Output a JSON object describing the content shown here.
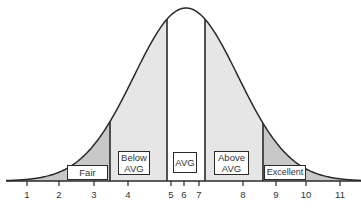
{
  "chart_data": {
    "type": "area",
    "title": "",
    "x_ticks": [
      1,
      2,
      3,
      4,
      5,
      6,
      7,
      8,
      9,
      10,
      11
    ],
    "xlim": [
      0.5,
      11.5
    ],
    "grid": false,
    "mean": 6,
    "bands": [
      {
        "name": "Fair",
        "range_px": [
          0,
          110
        ],
        "fill": "#c8c8c8"
      },
      {
        "name": "Below AVG",
        "range_px": [
          110,
          167
        ],
        "fill": "#e6e6e6"
      },
      {
        "name": "AVG",
        "range_px": [
          167,
          205
        ],
        "fill": "#ffffff"
      },
      {
        "name": "Above AVG",
        "range_px": [
          205,
          263
        ],
        "fill": "#e6e6e6"
      },
      {
        "name": "Excellent",
        "range_px": [
          263,
          361
        ],
        "fill": "#c8c8c8"
      }
    ]
  },
  "labels": {
    "fair": "Fair",
    "below_1": "Below",
    "below_2": "AVG",
    "avg": "AVG",
    "above_1": "Above",
    "above_2": "AVG",
    "excellent": "Excellent"
  },
  "ticks": [
    "1",
    "2",
    "3",
    "4",
    "5",
    "6",
    "7",
    "8",
    "9",
    "10",
    "11"
  ],
  "colors": {
    "outline": "#2a2a2a",
    "tail_fill": "#c8c8c8",
    "mid_fill": "#e6e6e6",
    "center_fill": "#ffffff"
  }
}
